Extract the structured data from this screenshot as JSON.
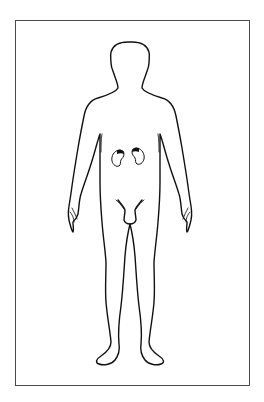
{
  "diagram": {
    "type": "anatomical-body-outline",
    "view": "anterior",
    "highlighted_organs": [
      "left-kidney",
      "right-kidney"
    ],
    "colors": {
      "background": "#ffffff",
      "frame_border": "#4a4a4a",
      "outline": "#111111",
      "organ_highlight": "#111111"
    }
  }
}
